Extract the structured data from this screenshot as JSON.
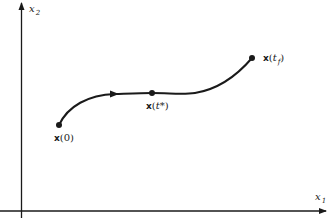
{
  "diagram": {
    "type": "state-space trajectory",
    "axes": {
      "x_axis": {
        "label": "x",
        "subscript": "1"
      },
      "y_axis": {
        "label": "x",
        "subscript": "2"
      }
    },
    "points": [
      {
        "id": "start",
        "vec": "x",
        "open": "(",
        "arg": "0",
        "close": ")"
      },
      {
        "id": "intermediate",
        "vec": "x",
        "open": "(",
        "arg": "t*",
        "close": ")"
      },
      {
        "id": "final",
        "vec": "x",
        "open": "(",
        "arg": "t",
        "arg_sub": "f",
        "close": ")"
      }
    ],
    "colors": {
      "line": "#1a1a1a",
      "background": "#ffffff"
    }
  }
}
